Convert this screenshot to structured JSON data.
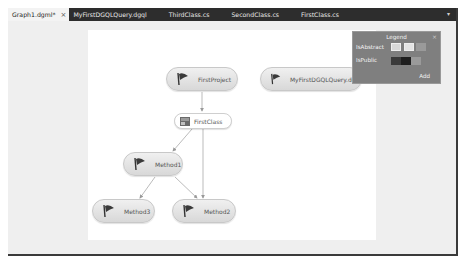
{
  "tabs": [
    {
      "label": "Graph1.dgml*",
      "active": true,
      "close": "×"
    },
    {
      "label": "MyFirstDGQLQuery.dgql",
      "active": false
    },
    {
      "label": "ThirdClass.cs",
      "active": false
    },
    {
      "label": "SecondClass.cs",
      "active": false
    },
    {
      "label": "FirstClass.cs",
      "active": false
    }
  ],
  "tab_dropdown": "▾",
  "graph": {
    "nodes": [
      {
        "id": "FirstProject",
        "label": "FirstProject",
        "icon": "flag-icon"
      },
      {
        "id": "MyFirstDGQLQuery",
        "label": "MyFirstDGQLQuery.dgql",
        "icon": "flag-icon"
      },
      {
        "id": "FirstClass",
        "label": "FirstClass",
        "icon": "class-icon"
      },
      {
        "id": "Method1",
        "label": "Method1",
        "icon": "flag-icon"
      },
      {
        "id": "Method3",
        "label": "Method3",
        "icon": "flag-icon"
      },
      {
        "id": "Method2",
        "label": "Method2",
        "icon": "flag-icon"
      }
    ],
    "edges": [
      {
        "from": "FirstProject",
        "to": "FirstClass"
      },
      {
        "from": "FirstClass",
        "to": "Method1"
      },
      {
        "from": "FirstClass",
        "to": "Method2"
      },
      {
        "from": "Method1",
        "to": "Method3"
      },
      {
        "from": "Method1",
        "to": "Method2"
      }
    ]
  },
  "legend": {
    "title": "Legend",
    "close": "×",
    "rows": [
      {
        "label": "IsAbstract",
        "swatches": [
          "#dcdcdc",
          "#e8e8e8",
          "#9a9a9a"
        ]
      },
      {
        "label": "IsPublic",
        "swatches": [
          "#3a3a3a",
          "#1e1e1e",
          "#9a9a9a"
        ]
      }
    ],
    "add_label": "Add"
  }
}
